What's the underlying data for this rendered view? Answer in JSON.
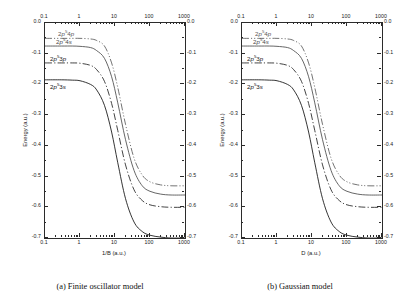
{
  "figure": {
    "panels": [
      {
        "id": "a",
        "subcaption": "(a) Finite oscillator model",
        "xlabel": "1/B (a.u.)",
        "ylabel": "Energy (a.u.)"
      },
      {
        "id": "b",
        "subcaption": "(b) Gaussian model",
        "xlabel": "D (a.u.)",
        "ylabel": "Energy (a.u.)"
      }
    ]
  },
  "chart_data": {
    "type": "line",
    "title": "",
    "xlabel_panel_a": "1/B (a.u.)",
    "xlabel_panel_b": "D (a.u.)",
    "ylabel": "Energy (a.u.)",
    "xscale": "log",
    "xlim": [
      0.1,
      1000
    ],
    "ylim": [
      -0.7,
      0.0
    ],
    "xticks": [
      "0.1",
      "1",
      "10",
      "100",
      "1000"
    ],
    "xtick_values": [
      0.1,
      1,
      10,
      100,
      1000
    ],
    "yticks": [
      "0.0",
      "-0.1",
      "-0.2",
      "-0.3",
      "-0.4",
      "-0.5",
      "-0.6",
      "-0.7"
    ],
    "ytick_values": [
      0.0,
      -0.1,
      -0.2,
      -0.3,
      -0.4,
      -0.5,
      -0.6,
      -0.7
    ],
    "grid": false,
    "legend": "inline-curve-labels",
    "mirrored_axes": true,
    "series": [
      {
        "name": "2p54p",
        "label_html": "2<i>p</i><sup>5</sup>4<i>p</i>",
        "linestyle": "dash-dot-dot",
        "color": "#5a5a5a",
        "plateau": -0.05,
        "asymptote": -0.53,
        "x": [
          0.1,
          0.3,
          0.6,
          1,
          2,
          3,
          5,
          8,
          12,
          20,
          35,
          60,
          100,
          200,
          400,
          1000
        ],
        "y": [
          -0.05,
          -0.05,
          -0.05,
          -0.05,
          -0.052,
          -0.057,
          -0.075,
          -0.13,
          -0.21,
          -0.33,
          -0.44,
          -0.495,
          -0.517,
          -0.527,
          -0.53,
          -0.53
        ]
      },
      {
        "name": "2p54s",
        "label_html": "2<i>p</i><sup>5</sup>4<i>s</i>",
        "linestyle": "solid",
        "color": "#4a4a4a",
        "plateau": -0.075,
        "asymptote": -0.56,
        "x": [
          0.1,
          0.3,
          0.6,
          1,
          2,
          3,
          5,
          8,
          12,
          20,
          35,
          60,
          100,
          200,
          400,
          1000
        ],
        "y": [
          -0.075,
          -0.075,
          -0.075,
          -0.076,
          -0.08,
          -0.09,
          -0.115,
          -0.175,
          -0.26,
          -0.38,
          -0.48,
          -0.53,
          -0.548,
          -0.557,
          -0.56,
          -0.56
        ]
      },
      {
        "name": "2p53p",
        "label_html": "2<i>p</i><sup>5</sup>3<i>p</i>",
        "linestyle": "dash-dot",
        "color": "#222222",
        "plateau": -0.13,
        "asymptote": -0.6,
        "x": [
          0.1,
          0.3,
          0.6,
          1,
          2,
          3,
          5,
          8,
          12,
          20,
          35,
          60,
          100,
          200,
          400,
          1000
        ],
        "y": [
          -0.13,
          -0.13,
          -0.13,
          -0.131,
          -0.138,
          -0.152,
          -0.19,
          -0.262,
          -0.35,
          -0.462,
          -0.543,
          -0.578,
          -0.592,
          -0.598,
          -0.6,
          -0.6
        ]
      },
      {
        "name": "2p53s",
        "label_html": "2<i>p</i><sup>5</sup>3<i>s</i>",
        "linestyle": "solid",
        "color": "#111111",
        "plateau": -0.185,
        "asymptote": -0.7,
        "x": [
          0.1,
          0.3,
          0.6,
          1,
          2,
          3,
          5,
          8,
          12,
          20,
          35,
          60,
          100,
          200,
          400,
          1000
        ],
        "y": [
          -0.185,
          -0.185,
          -0.186,
          -0.188,
          -0.2,
          -0.218,
          -0.268,
          -0.355,
          -0.455,
          -0.572,
          -0.648,
          -0.679,
          -0.691,
          -0.697,
          -0.7,
          -0.7
        ]
      }
    ]
  }
}
